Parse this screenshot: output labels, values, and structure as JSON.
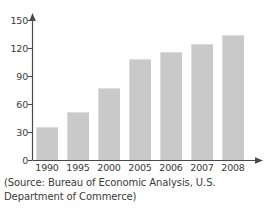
{
  "chart_data": {
    "type": "bar",
    "title": "",
    "xlabel": "",
    "ylabel": "",
    "categories": [
      "1990",
      "1995",
      "2000",
      "2005",
      "2006",
      "2007",
      "2008"
    ],
    "values": [
      35,
      51,
      77,
      108,
      116,
      124,
      134
    ],
    "ylim": [
      0,
      160
    ],
    "yticks": [
      0,
      30,
      60,
      90,
      120,
      150
    ],
    "ytick_labels": [
      "0",
      "30",
      "60",
      "90",
      "120",
      "150"
    ],
    "grid": false,
    "legend": false,
    "bar_color": "#c9c9c9",
    "axis_color": "#4a4a4a",
    "text_color": "#3a3a3a"
  },
  "caption": {
    "source_note": "(Source: Bureau of Economic Analysis, U.S. Department of Commerce)"
  },
  "axes": {
    "y_arrow_name": "y-axis-arrow",
    "x_arrow_name": "x-axis-arrow"
  }
}
